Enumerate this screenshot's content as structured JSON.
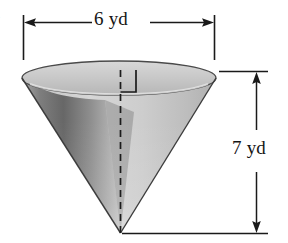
{
  "figure": {
    "item_number": ".",
    "shape_name": "cone",
    "orientation": "inverted",
    "width_dimension": {
      "label": "6 yd",
      "value": 6,
      "unit": "yd",
      "measures": "diameter"
    },
    "height_dimension": {
      "label": "7 yd",
      "value": 7,
      "unit": "yd",
      "measures": "height"
    },
    "markers": {
      "right_angle": "right-angle-marker",
      "axis": "dashed-center-axis"
    },
    "colors": {
      "outline": "#3c3c3c",
      "dimension_line": "#1a1a1a",
      "surface_light": "#d2d2d2",
      "surface_mid": "#b4b4b4",
      "surface_dark": "#6e6e6e",
      "rim": "#cfcfcf",
      "background": "#ffffff"
    }
  }
}
